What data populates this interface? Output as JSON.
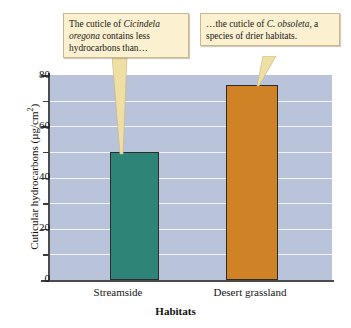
{
  "chart_data": {
    "type": "bar",
    "title": "",
    "categories": [
      "Streamside",
      "Desert grassland"
    ],
    "values": [
      50,
      76
    ],
    "xlabel": "Habitats",
    "ylabel": "Cuticular hydrocarbons (µg/cm²)",
    "ylim": [
      0,
      80
    ],
    "y_major_ticks": [
      0,
      20,
      40,
      60,
      80
    ],
    "y_minor_ticks": [
      10,
      30,
      50,
      70
    ],
    "grid": true,
    "grid_orientation": "horizontal",
    "legend": "none",
    "series": [
      {
        "name": "Cuticular hydrocarbons",
        "values": [
          50,
          76
        ],
        "colors": [
          "#2e8476",
          "#cf8326"
        ]
      }
    ],
    "annotations": [
      {
        "target": "Streamside",
        "text": "The cuticle of Cicindela oregona contains less hydrocarbons than…"
      },
      {
        "target": "Desert grassland",
        "text": "…the cuticle of C. obsoleta, a species of drier habitats."
      }
    ]
  },
  "axes": {
    "y": {
      "title_main": "Cuticular hydrocarbons (µg/cm",
      "title_sup": "2",
      "title_tail": ")",
      "tick_80": "80",
      "tick_60": "60",
      "tick_40": "40",
      "tick_20": "20",
      "tick_0": "0"
    },
    "x": {
      "title": "Habitats",
      "label_1": "Streamside",
      "label_2": "Desert grassland"
    }
  },
  "callouts": {
    "left": {
      "part1": "The cuticle of ",
      "species": "Cicindela oregona",
      "part2": " contains less hydrocarbons than…"
    },
    "right": {
      "part1": "…the cuticle of ",
      "species": "C. obsoleta",
      "part2": ", a species of drier habitats."
    }
  },
  "colors": {
    "bar_streamside": "#2e8476",
    "bar_desert": "#cf8326",
    "plot_background": "#b9c3da",
    "gridline": "#f2f4f9",
    "callout_fill": "#fbf0cf",
    "callout_border": "#c9b88b",
    "pointer_fill": "#f0dfa4",
    "axis": "#4b4b4b"
  }
}
